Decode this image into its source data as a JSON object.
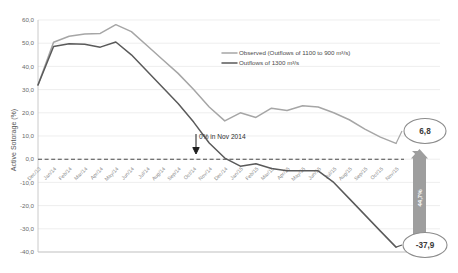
{
  "chart_data": {
    "type": "line",
    "title": "",
    "xlabel": "",
    "ylabel": "Active Sotorage (%)",
    "ylim": [
      -40,
      60
    ],
    "ytick_labels": [
      "60,0",
      "50,0",
      "40,0",
      "30,0",
      "20,0",
      "10,0",
      "0,0",
      "-10,0",
      "-20,0",
      "-30,0",
      "-40,0"
    ],
    "ytick_values": [
      60,
      50,
      40,
      30,
      20,
      10,
      0,
      -10,
      -20,
      -30,
      -40
    ],
    "grid": true,
    "legend_position": "upper-right",
    "categories": [
      "Dec/13",
      "Jan/14",
      "Feb/14",
      "Mar/14",
      "Apr/14",
      "May/14",
      "Jun/14",
      "Jul/14",
      "Aug/14",
      "Sep/14",
      "Oct/14",
      "Nov/14",
      "Dec/14",
      "Jan/15",
      "Feb/15",
      "Mar/15",
      "Apr/15",
      "May/15",
      "Jun/15",
      "Jul/15",
      "Aug/15",
      "Sep/15",
      "Oct/15",
      "Nov/15"
    ],
    "series": [
      {
        "name": "Observed (Outflows of 1100 to 900 m³/s)",
        "color": "#a6a6a6",
        "values": [
          32.0,
          50.4,
          53.0,
          54.0,
          54.2,
          58.0,
          55.0,
          49.0,
          43.0,
          37.0,
          30.0,
          22.5,
          16.5,
          20.0,
          18.0,
          22.0,
          21.0,
          23.0,
          22.5,
          20.0,
          17.0,
          13.0,
          9.5,
          6.8
        ]
      },
      {
        "name": "Outflows of 1300 m³/s",
        "color": "#5a5a5a",
        "values": [
          32.0,
          48.6,
          49.8,
          49.5,
          48.3,
          50.5,
          45.0,
          38.0,
          31.0,
          24.0,
          16.0,
          7.0,
          0.5,
          -3.0,
          -2.0,
          -4.0,
          -5.0,
          -5.0,
          -5.0,
          -10.0,
          -17.0,
          -24.0,
          -31.0,
          -37.9
        ]
      }
    ],
    "annotations": [
      {
        "name": "zero-crossing-note",
        "text": "0% in Nov 2014",
        "x_category": "Dec/14",
        "y": 0
      },
      {
        "name": "observed-endpoint-callout",
        "text": "6,8",
        "value": 6.8
      },
      {
        "name": "outflow-endpoint-callout",
        "text": "-37,9",
        "value": -37.9
      },
      {
        "name": "difference-bar",
        "text": "44,7%",
        "value": 44.7
      }
    ],
    "zero_reference_line": 0
  },
  "legend": {
    "items": [
      {
        "label": "Observed (Outflows of 1100 to 900 m³/s)",
        "color": "#a6a6a6"
      },
      {
        "label": "Outflows of 1300 m³/s",
        "color": "#5a5a5a"
      }
    ]
  },
  "labels": {
    "y_axis_title": "Active Sotorage (%)",
    "annotation_zero": "0% in Nov 2014",
    "callout_top": "6,8",
    "callout_bottom": "-37,9",
    "delta_label": "44,7%"
  }
}
